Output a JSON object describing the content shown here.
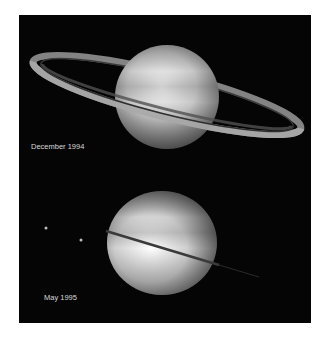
{
  "figure": {
    "panels": [
      {
        "label": "December 1994",
        "subject": "saturn-rings-tilted"
      },
      {
        "label": "May 1995",
        "subject": "saturn-rings-edge-on"
      }
    ],
    "colors": {
      "background": "#050505",
      "page": "#ffffff",
      "label": "#d8d8d8"
    }
  }
}
